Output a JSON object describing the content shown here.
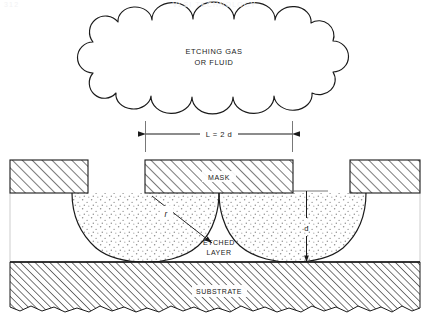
{
  "header": {
    "page_number": "312",
    "running_title": "VLSI TECHNOLOGY"
  },
  "figure": {
    "cloud_label_line1": "ETCHING GAS",
    "cloud_label_line2": "OR  FLUID",
    "mask_label": "MASK",
    "etched_layer_line1": "ETCHED",
    "etched_layer_line2": "LAYER",
    "substrate_label": "SUBSTRATE",
    "dimension_width": "L = 2 d",
    "dimension_depth": "d",
    "radius_label": "r"
  },
  "colors": {
    "line": "#1a1a1a",
    "background": "#ffffff",
    "hatch": "#333333",
    "stipple": "#9a9a9a",
    "header_text": "#f2f2f4"
  }
}
